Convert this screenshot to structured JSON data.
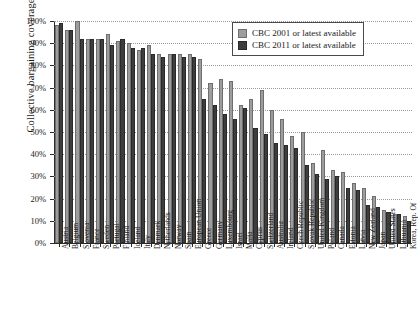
{
  "chart_data": {
    "type": "bar",
    "title": "",
    "xlabel": "",
    "ylabel": "Collective bargaining coverage",
    "ylim": [
      0,
      100
    ],
    "ytick_labels": [
      "0%",
      "10%",
      "20%",
      "30%",
      "40%",
      "50%",
      "60%",
      "70%",
      "80%",
      "90%",
      "100%"
    ],
    "ytick_values": [
      0,
      10,
      20,
      30,
      40,
      50,
      60,
      70,
      80,
      90,
      100
    ],
    "grid": true,
    "legend_position": "top-right",
    "colors": {
      "series_2001": "#9d9d9d",
      "series_2011": "#3d3d3d",
      "axis": "#2b2b2b",
      "gridline": "#9a9a9a",
      "background": "#ffffff"
    },
    "categories": [
      "Austria",
      "Belgium",
      "Slovenia",
      "France",
      "Sweden",
      "Portugal",
      "Finland",
      "Iceland",
      "Italy",
      "Denmark",
      "Netherlands",
      "Norway",
      "Spain",
      "European Union",
      "Greece",
      "Germany",
      "Luxembourg",
      "Israel",
      "Malta",
      "Cyprus",
      "Switzerland",
      "Australia",
      "Ireland",
      "Czech Republic",
      "Slovak Republic",
      "United Kingdom",
      "Poland",
      "Canada",
      "Estonia",
      "Latvia",
      "New Zealand",
      "Japan",
      "United States",
      "Lithuania",
      "Korea, Rep. Of"
    ],
    "series": [
      {
        "name": "CBC 2001 or latest available",
        "values": [
          98,
          96,
          100,
          92,
          92,
          94,
          91,
          90,
          87,
          89,
          85,
          85,
          85,
          85,
          83,
          72,
          74,
          73,
          62,
          65,
          69,
          60,
          56,
          48,
          50,
          36,
          42,
          33,
          32,
          27,
          25,
          21,
          15,
          13,
          12
        ]
      },
      {
        "name": "CBC 2011 or latest available",
        "values": [
          99,
          96,
          92,
          92,
          92,
          89,
          92,
          88,
          88,
          85,
          84,
          85,
          84,
          84,
          65,
          62,
          58,
          56,
          61,
          52,
          49,
          45,
          44,
          43,
          35,
          31,
          29,
          30,
          25,
          24,
          17,
          16,
          14,
          13,
          10
        ]
      }
    ]
  },
  "legend": {
    "entries": [
      {
        "label": "CBC 2001 or latest available",
        "swatch": "series_2001"
      },
      {
        "label": "CBC 2011 or latest available",
        "swatch": "series_2011"
      }
    ]
  }
}
